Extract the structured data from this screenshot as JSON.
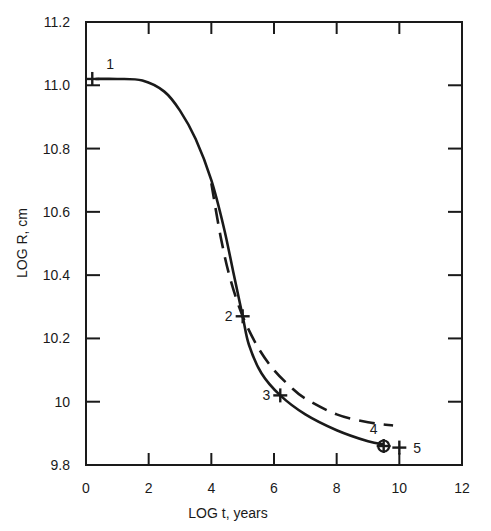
{
  "chart_data": {
    "type": "line",
    "title": "",
    "xlabel": "LOG  t, years",
    "ylabel": "LOG R, cm",
    "xlim": [
      0,
      12
    ],
    "ylim": [
      9.8,
      11.2
    ],
    "x_ticks": [
      "0",
      "2",
      "4",
      "6",
      "8",
      "10",
      "12"
    ],
    "y_ticks": [
      "9.8",
      "10",
      "10.2",
      "10.4",
      "10.6",
      "10.8",
      "11.0",
      "11.2"
    ],
    "grid": false,
    "legend": null,
    "series": [
      {
        "name": "solid curve",
        "style": "solid",
        "x": [
          0.3,
          1.0,
          1.8,
          2.5,
          3.0,
          3.5,
          4.0,
          4.4,
          4.7,
          5.0,
          5.2,
          5.6,
          6.2,
          7.0,
          8.0,
          9.0,
          9.5
        ],
        "y": [
          11.02,
          11.02,
          11.015,
          10.98,
          10.92,
          10.83,
          10.7,
          10.55,
          10.41,
          10.27,
          10.18,
          10.09,
          10.02,
          9.96,
          9.91,
          9.875,
          9.865
        ]
      },
      {
        "name": "dashed curve",
        "style": "dashed",
        "x": [
          4.0,
          4.3,
          4.6,
          5.0,
          5.5,
          6.0,
          6.5,
          7.0,
          8.0,
          9.0,
          9.8
        ],
        "y": [
          10.69,
          10.52,
          10.39,
          10.27,
          10.17,
          10.1,
          10.05,
          10.01,
          9.96,
          9.935,
          9.925
        ]
      }
    ],
    "annotations": [
      {
        "label": "1",
        "x": 0.2,
        "y": 11.02,
        "marker": "plus"
      },
      {
        "label": "2",
        "x": 5.0,
        "y": 10.27,
        "marker": "plus"
      },
      {
        "label": "3",
        "x": 6.2,
        "y": 10.02,
        "marker": "plus"
      },
      {
        "label": "4",
        "x": 9.5,
        "y": 9.86,
        "marker": "circled-plus"
      },
      {
        "label": "5",
        "x": 10.0,
        "y": 9.855,
        "marker": "plus"
      }
    ]
  },
  "colors": {
    "ink": "#1a1a1a",
    "background": "#ffffff"
  }
}
